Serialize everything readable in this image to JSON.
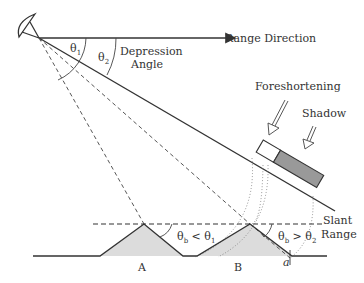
{
  "labels": {
    "theta1": "θ",
    "theta1_sub": "1",
    "theta2": "θ",
    "theta2_sub": "2",
    "depression_line1": "Depression",
    "depression_line2": "Angle",
    "range_direction": "Range Direction",
    "foreshortening": "Foreshortening",
    "shadow": "Shadow",
    "slant_line1": "Slant",
    "slant_line2": "Range",
    "cond_a_theta": "θ",
    "cond_a_sub_b": "b",
    "cond_a_op": " < θ",
    "cond_a_sub": "1",
    "cond_b_theta": "θ",
    "cond_b_sub_b": "b",
    "cond_b_op": " > θ",
    "cond_b_sub": "2",
    "point_a": "A",
    "point_b": "B",
    "point_small_a": "a"
  },
  "colors": {
    "line": "#333333",
    "shadow_fill": "#999999",
    "terrain_fill": "#dcdcdc"
  }
}
